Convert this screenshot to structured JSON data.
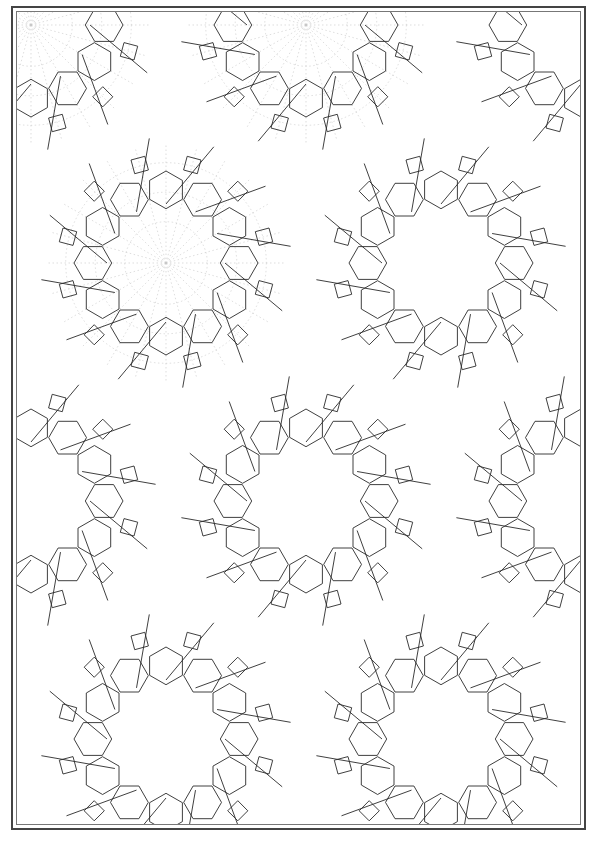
{
  "page": {
    "page_number": "",
    "colors": {
      "line": "#2a2a2a",
      "guide": "#c8c8c8",
      "frame": "#444444",
      "background": "#ffffff"
    }
  },
  "pattern": {
    "description": "Islamic geometric interlace pattern with twelve-fold rosettes",
    "construction_guides_region": {
      "x": 0,
      "y": 0,
      "w": 290,
      "h": 440
    },
    "rosettes": [
      {
        "cx": 149,
        "cy": 251,
        "r": 118,
        "n": 12
      },
      {
        "cx": 424,
        "cy": 251,
        "r": 118,
        "n": 12
      },
      {
        "cx": 289,
        "cy": 489,
        "r": 118,
        "n": 12
      },
      {
        "cx": 14,
        "cy": 489,
        "r": 118,
        "n": 12
      },
      {
        "cx": 564,
        "cy": 489,
        "r": 118,
        "n": 12
      },
      {
        "cx": 149,
        "cy": 727,
        "r": 118,
        "n": 12
      },
      {
        "cx": 424,
        "cy": 727,
        "r": 118,
        "n": 12
      },
      {
        "cx": 289,
        "cy": 13,
        "r": 118,
        "n": 12
      },
      {
        "cx": 14,
        "cy": 13,
        "r": 118,
        "n": 12
      },
      {
        "cx": 564,
        "cy": 13,
        "r": 118,
        "n": 12
      },
      {
        "cx": 289,
        "cy": 965,
        "r": 118,
        "n": 12
      },
      {
        "cx": 14,
        "cy": 965,
        "r": 118,
        "n": 12
      },
      {
        "cx": 564,
        "cy": 965,
        "r": 118,
        "n": 12
      }
    ]
  }
}
